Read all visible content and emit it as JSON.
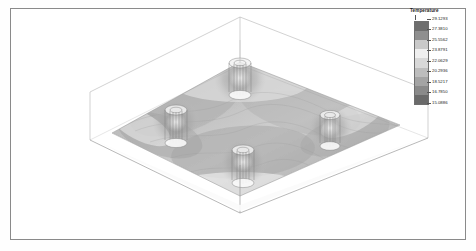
{
  "figure": {
    "background": "#ffffff",
    "border_color": "#8a8a8a",
    "width": 476,
    "height": 251
  },
  "legend": {
    "title": "Temperature",
    "orientation": "vertical",
    "position": "top-right",
    "colormap": "grayscale-banded",
    "ticks": [
      "29.1293",
      "27.3810",
      "25.5562",
      "23.8791",
      "22.0629",
      "20.2936",
      "18.5217",
      "16.7850",
      "15.0886"
    ],
    "band_colors": [
      "#6e6e6e",
      "#8f8f8f",
      "#c9c9c9",
      "#efefef",
      "#d8d8d8",
      "#bdbdbd",
      "#a4a4a4",
      "#8a8a8a",
      "#6a6a6a"
    ]
  },
  "chart_data": {
    "type": "heatmap",
    "title": "Temperature",
    "subtitle": "",
    "xlabel": "",
    "ylabel": "",
    "view": "3D isometric",
    "legend_position": "top-right",
    "grid": false,
    "colorbar_label": "Temperature",
    "value_range": [
      15.0886,
      29.1293
    ],
    "contour_levels": [
      15.0886,
      16.785,
      18.5217,
      20.2936,
      22.0629,
      23.8791,
      25.5562,
      27.381,
      29.1293
    ],
    "slice_plane": "horizontal mid-depth section",
    "features": [
      {
        "name": "energy-pile-back",
        "plan_position": [
          0.5,
          0.12
        ],
        "type": "vertical cylinder with U-tubes"
      },
      {
        "name": "energy-pile-left",
        "plan_position": [
          0.2,
          0.44
        ],
        "type": "vertical cylinder with U-tubes"
      },
      {
        "name": "energy-pile-right",
        "plan_position": [
          0.79,
          0.5
        ],
        "type": "vertical cylinder with U-tubes"
      },
      {
        "name": "energy-pile-front",
        "plan_position": [
          0.5,
          0.78
        ],
        "type": "vertical cylinder with U-tubes"
      }
    ],
    "domain_box": {
      "shape": "rectangular prism",
      "edges_visible": true,
      "edge_color": "#9a9a9a"
    }
  }
}
